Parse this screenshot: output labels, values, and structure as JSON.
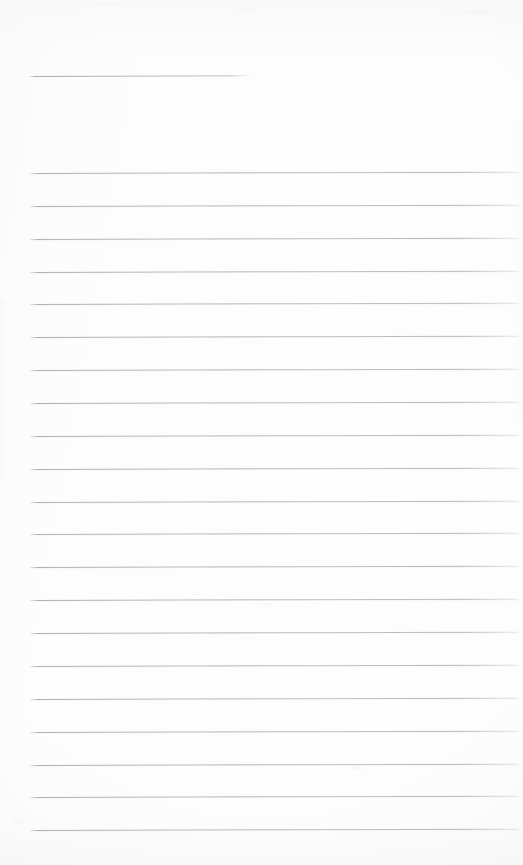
{
  "document": {
    "kind": "scanned-blank-ruled-notepaper",
    "title": "",
    "page_width": 523,
    "page_height": 865,
    "background_color": "#fdfdfd",
    "rule_color": "#aeb2b8",
    "text_content": "",
    "visible_text": []
  },
  "header_rule": {
    "label": "",
    "x": 29,
    "y": 76,
    "width": 220,
    "tilt_deg": -0.22
  },
  "body_rules": {
    "count": 21,
    "first_y": 173,
    "spacing": 32.85,
    "x": 30,
    "width": 490,
    "tilt_deg": -0.16,
    "lines": [
      {
        "index": 1,
        "y": 173,
        "text": ""
      },
      {
        "index": 2,
        "y": 206,
        "text": ""
      },
      {
        "index": 3,
        "y": 239,
        "text": ""
      },
      {
        "index": 4,
        "y": 272,
        "text": ""
      },
      {
        "index": 5,
        "y": 304,
        "text": ""
      },
      {
        "index": 6,
        "y": 337,
        "text": ""
      },
      {
        "index": 7,
        "y": 370,
        "text": ""
      },
      {
        "index": 8,
        "y": 403,
        "text": ""
      },
      {
        "index": 9,
        "y": 436,
        "text": ""
      },
      {
        "index": 10,
        "y": 469,
        "text": ""
      },
      {
        "index": 11,
        "y": 502,
        "text": ""
      },
      {
        "index": 12,
        "y": 534,
        "text": ""
      },
      {
        "index": 13,
        "y": 567,
        "text": ""
      },
      {
        "index": 14,
        "y": 600,
        "text": ""
      },
      {
        "index": 15,
        "y": 633,
        "text": ""
      },
      {
        "index": 16,
        "y": 666,
        "text": ""
      },
      {
        "index": 17,
        "y": 699,
        "text": ""
      },
      {
        "index": 18,
        "y": 732,
        "text": ""
      },
      {
        "index": 19,
        "y": 765,
        "text": ""
      },
      {
        "index": 20,
        "y": 797,
        "text": ""
      },
      {
        "index": 21,
        "y": 830,
        "text": ""
      }
    ]
  }
}
